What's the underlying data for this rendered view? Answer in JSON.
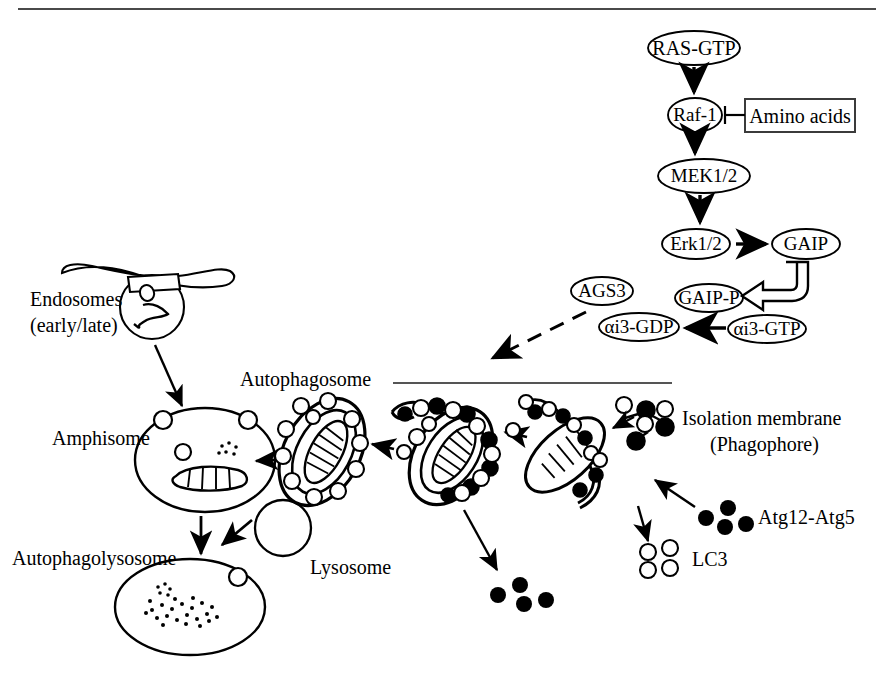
{
  "figure": {
    "title_rule": "top-border-rule",
    "colors": {
      "ink": "#000000",
      "rule": "#4a4a4a",
      "fill_white": "#ffffff",
      "fill_black": "#000000"
    }
  },
  "signaling": {
    "nodes": [
      {
        "id": "ras_gtp",
        "label": "RAS-GTP",
        "shape": "ellipse",
        "cx": 694,
        "cy": 48,
        "rx": 46,
        "ry": 17,
        "font": 20
      },
      {
        "id": "raf1",
        "label": "Raf-1",
        "shape": "ellipse",
        "cx": 695,
        "cy": 115,
        "rx": 27,
        "ry": 17,
        "font": 19
      },
      {
        "id": "mek12",
        "label": "MEK1/2",
        "shape": "ellipse",
        "cx": 704,
        "cy": 176,
        "rx": 46,
        "ry": 17,
        "font": 19
      },
      {
        "id": "erk12",
        "label": "Erk1/2",
        "shape": "ellipse",
        "cx": 696,
        "cy": 244,
        "rx": 34,
        "ry": 15,
        "font": 19
      },
      {
        "id": "gaip",
        "label": "GAIP",
        "shape": "ellipse",
        "cx": 806,
        "cy": 244,
        "rx": 34,
        "ry": 15,
        "font": 19
      },
      {
        "id": "ags3",
        "label": "AGS3",
        "shape": "ellipse",
        "cx": 602,
        "cy": 291,
        "rx": 31,
        "ry": 14,
        "font": 19
      },
      {
        "id": "gaip_p",
        "label": "GAIP-P",
        "shape": "ellipse",
        "cx": 709,
        "cy": 298,
        "rx": 34,
        "ry": 14,
        "font": 19
      },
      {
        "id": "ai3_gdp",
        "label": "αi3-GDP",
        "shape": "ellipse",
        "cx": 639,
        "cy": 327,
        "rx": 40,
        "ry": 14,
        "font": 19
      },
      {
        "id": "ai3_gtp",
        "label": "αi3-GTP",
        "shape": "ellipse",
        "cx": 767,
        "cy": 329,
        "rx": 39,
        "ry": 14,
        "font": 19
      }
    ],
    "box": {
      "id": "amino_acids",
      "label": "Amino acids",
      "x": 745,
      "y": 99,
      "w": 110,
      "h": 33,
      "font": 20
    },
    "edges": [
      {
        "id": "ras-to-raf",
        "type": "arrow-down"
      },
      {
        "id": "raf-to-mek",
        "type": "arrow-down"
      },
      {
        "id": "mek-to-erk",
        "type": "arrow-down"
      },
      {
        "id": "erk-to-gaip",
        "type": "arrow-right"
      },
      {
        "id": "aa-inhibits-raf",
        "type": "inhibition-bar"
      },
      {
        "id": "gaip-to-gaipp",
        "type": "hook-block-arrow"
      },
      {
        "id": "gtp-to-gdp",
        "type": "arrow-left"
      },
      {
        "id": "ags3-dashed",
        "type": "dashed-link"
      },
      {
        "id": "cascade-to-autophagy",
        "type": "dashed-arrow-down-left"
      }
    ]
  },
  "labels": {
    "endosomes_line1": "Endosomes",
    "endosomes_line2": "(early/late)",
    "autophagosome": "Autophagosome",
    "amphisome": "Amphisome",
    "autophagolysosome": "Autophagolysosome",
    "lysosome": "Lysosome",
    "isolation_membrane_line1": "Isolation membrane",
    "isolation_membrane_line2": "(Phagophore)",
    "atg12_atg5": "Atg12-Atg5",
    "lc3": "LC3"
  },
  "organelles": [
    {
      "id": "endosome",
      "name": "endosome-tubule-vesicle",
      "cx": 140,
      "cy": 285
    },
    {
      "id": "amphisome",
      "name": "amphisome-vesicle",
      "cx": 205,
      "cy": 460
    },
    {
      "id": "autophagolysosome",
      "name": "autophagolysosome-vesicle",
      "cx": 190,
      "cy": 605
    },
    {
      "id": "lysosome",
      "name": "lysosome-vesicle",
      "cx": 283,
      "cy": 528
    },
    {
      "id": "autophagosome_closed",
      "name": "autophagosome-closed-lc3-coated",
      "cx": 322,
      "cy": 452
    },
    {
      "id": "autophagosome_closing",
      "name": "autophagosome-closing-atg-coated",
      "cx": 440,
      "cy": 452
    },
    {
      "id": "isolation_membrane",
      "name": "isolation-membrane-phagophore",
      "cx": 572,
      "cy": 445
    },
    {
      "id": "atg_nucleation",
      "name": "atg-protein-nucleation-cluster",
      "cx": 645,
      "cy": 430
    }
  ],
  "particles": {
    "atg12_atg5_cluster": {
      "count": 5,
      "fill": "black",
      "cx": 720,
      "cy": 515
    },
    "lc3_cluster": {
      "count": 4,
      "fill": "white",
      "cx": 648,
      "cy": 555
    },
    "degraded_cluster": {
      "count": 4,
      "fill": "black",
      "cx": 500,
      "cy": 593
    }
  }
}
